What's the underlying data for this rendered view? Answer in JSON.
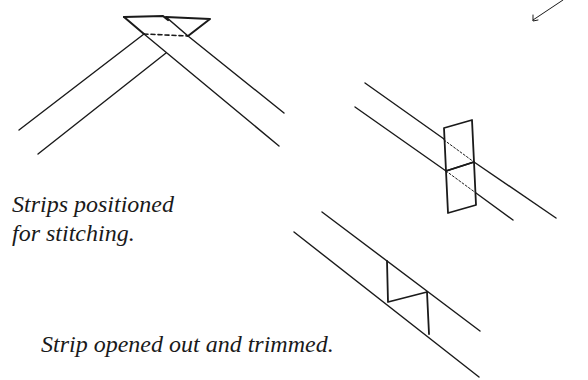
{
  "captions": {
    "positioned": {
      "line1": "Strips positioned",
      "line2": "for stitching."
    },
    "opened": "Strip opened out and trimmed."
  },
  "colors": {
    "ink": "#1a1a1a",
    "background": "#ffffff"
  },
  "figures": [
    {
      "id": "strips-positioned",
      "description": "Two fabric strips crossed at right angles with diagonal stitch line (dashed)"
    },
    {
      "id": "strip-stitched-folded",
      "description": "Joined strip with seam allowance folded, stitch line dotted"
    },
    {
      "id": "strip-opened-trimmed",
      "description": "Strip opened out with seam trimmed"
    }
  ]
}
